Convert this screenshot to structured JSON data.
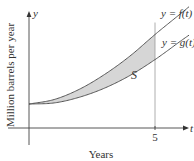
{
  "chart_data": {
    "type": "area",
    "title": "",
    "xlabel": "Years",
    "ylabel": "Million barrels per year",
    "x_axis_symbol": "t",
    "y_axis_symbol": "y",
    "x_ticks": [
      {
        "value": 5,
        "label": "5"
      }
    ],
    "xlim": [
      0,
      6.2
    ],
    "ylim": [
      0,
      10
    ],
    "grid": false,
    "series": [
      {
        "name": "y = f(t)",
        "label": "y = f(t)",
        "x": [
          0,
          1,
          2,
          3,
          4,
          5,
          6
        ],
        "values": [
          2.1,
          2.5,
          3.4,
          4.7,
          6.3,
          8.2,
          10.0
        ]
      },
      {
        "name": "y = g(t)",
        "label": "y = g(t)",
        "x": [
          0,
          1,
          2,
          3,
          4,
          5,
          6
        ],
        "values": [
          2.1,
          2.2,
          2.7,
          3.5,
          4.6,
          6.0,
          7.6
        ]
      }
    ],
    "shaded_region": {
      "label": "S",
      "from_series": "y = g(t)",
      "to_series": "y = f(t)",
      "x_range": [
        0,
        5
      ],
      "color": "#d6d6d6"
    },
    "reference_lines": [
      {
        "orientation": "vertical",
        "x": 5
      }
    ],
    "colors": {
      "curve": "#555555",
      "axis": "#444444",
      "fill": "#d6d6d6"
    }
  }
}
